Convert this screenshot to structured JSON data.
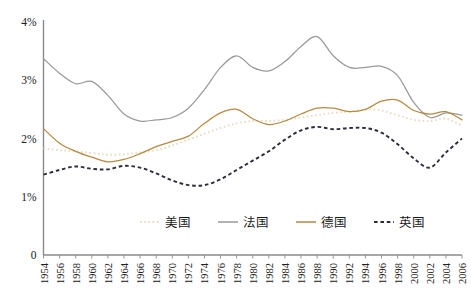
{
  "chart_data": {
    "type": "line",
    "title": "",
    "subtitle": "",
    "xlabel": "",
    "ylabel": "",
    "xlim": [
      1954,
      2007
    ],
    "ylim": [
      0,
      4
    ],
    "grid": false,
    "legend_position": "bottom-center",
    "ytick_labels": [
      "4%",
      "3%",
      "2%",
      "1%",
      "0"
    ],
    "ytick_values": [
      4,
      3,
      2,
      1,
      0
    ],
    "categories": [
      "1954",
      "1956",
      "1958",
      "1960",
      "1962",
      "1964",
      "1966",
      "1968",
      "1970",
      "1972",
      "1974",
      "1976",
      "1978",
      "1980",
      "1982",
      "1984",
      "1986",
      "1988",
      "1990",
      "1992",
      "1994",
      "1996",
      "1998",
      "2000",
      "2002",
      "2004",
      "2006"
    ],
    "x": [
      1954,
      1956,
      1958,
      1960,
      1962,
      1964,
      1966,
      1968,
      1970,
      1972,
      1974,
      1976,
      1978,
      1980,
      1982,
      1984,
      1986,
      1988,
      1990,
      1992,
      1994,
      1996,
      1998,
      2000,
      2002,
      2004,
      2006
    ],
    "series": [
      {
        "name": "美国",
        "name_en": "United States",
        "color": "#e8dcc0",
        "style": "dotted",
        "values": [
          1.83,
          1.8,
          1.78,
          1.75,
          1.72,
          1.73,
          1.76,
          1.8,
          1.88,
          1.98,
          2.08,
          2.18,
          2.26,
          2.3,
          2.3,
          2.32,
          2.36,
          2.4,
          2.44,
          2.46,
          2.5,
          2.48,
          2.4,
          2.32,
          2.3,
          2.34,
          2.22
        ]
      },
      {
        "name": "法国",
        "name_en": "France",
        "color": "#9a9a9a",
        "style": "solid",
        "values": [
          3.37,
          3.12,
          2.94,
          2.98,
          2.74,
          2.42,
          2.3,
          2.32,
          2.36,
          2.52,
          2.84,
          3.22,
          3.42,
          3.22,
          3.16,
          3.32,
          3.58,
          3.75,
          3.42,
          3.22,
          3.22,
          3.24,
          3.08,
          2.62,
          2.36,
          2.44,
          2.4
        ]
      },
      {
        "name": "德国",
        "name_en": "Germany",
        "color": "#b8893f",
        "style": "solid",
        "values": [
          2.17,
          1.92,
          1.78,
          1.68,
          1.6,
          1.64,
          1.74,
          1.86,
          1.95,
          2.04,
          2.26,
          2.44,
          2.5,
          2.34,
          2.24,
          2.3,
          2.42,
          2.52,
          2.52,
          2.46,
          2.5,
          2.64,
          2.66,
          2.48,
          2.42,
          2.46,
          2.32
        ]
      },
      {
        "name": "英国",
        "name_en": "United Kingdom",
        "color": "#2b2b3d",
        "style": "dashed",
        "values": [
          1.38,
          1.46,
          1.52,
          1.48,
          1.47,
          1.53,
          1.5,
          1.4,
          1.28,
          1.2,
          1.2,
          1.3,
          1.46,
          1.62,
          1.78,
          1.98,
          2.14,
          2.2,
          2.16,
          2.18,
          2.18,
          2.1,
          1.9,
          1.66,
          1.5,
          1.76,
          2.0
        ]
      }
    ],
    "legend": [
      {
        "label": "美国",
        "color": "#e8dcc0",
        "style": "dotted"
      },
      {
        "label": "法国",
        "color": "#9a9a9a",
        "style": "solid"
      },
      {
        "label": "德国",
        "color": "#b8893f",
        "style": "solid"
      },
      {
        "label": "英国",
        "color": "#2b2b3d",
        "style": "dashed"
      }
    ]
  },
  "axes": {
    "axis_color": "#8a8a8a"
  }
}
